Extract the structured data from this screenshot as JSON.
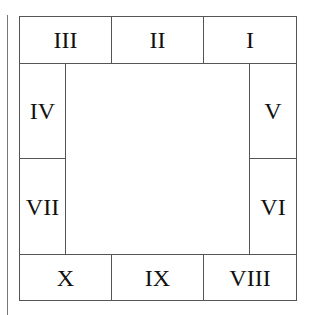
{
  "diagram": {
    "left_rule": true,
    "cells": [
      {
        "id": "III",
        "label": "III"
      },
      {
        "id": "II",
        "label": "II"
      },
      {
        "id": "I",
        "label": "I"
      },
      {
        "id": "IV",
        "label": "IV"
      },
      {
        "id": "V",
        "label": "V"
      },
      {
        "id": "VII",
        "label": "VII"
      },
      {
        "id": "VI",
        "label": "VI"
      },
      {
        "id": "X",
        "label": "X"
      },
      {
        "id": "IX",
        "label": "IX"
      },
      {
        "id": "VIII",
        "label": "VIII"
      }
    ]
  }
}
